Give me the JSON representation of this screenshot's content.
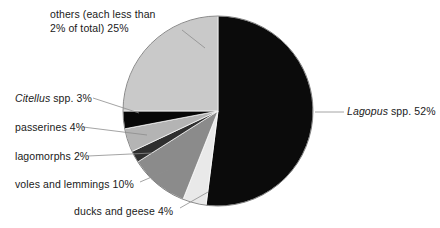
{
  "chart_data": {
    "type": "pie",
    "title": "",
    "subtitle": "",
    "xlabel": "",
    "ylabel": "",
    "legend_position": "none",
    "grid": false,
    "units": "percent of total",
    "total": 100,
    "start_angle_deg": 0,
    "direction": "clockwise",
    "categories": [
      "Lagopus spp.",
      "ducks and geese",
      "voles and lemmings",
      "lagomorphs",
      "passerines",
      "Citellus spp.",
      "others (each less than 2% of total)"
    ],
    "values": [
      52,
      4,
      10,
      2,
      4,
      3,
      25
    ],
    "slices": [
      {
        "id": "lagopus",
        "name_italic": "Lagopus",
        "name_rest": " spp.",
        "label": "Lagopus spp. 52%",
        "value_label": "52%",
        "value": 52,
        "color": "#0b0b0b",
        "label_side": "right"
      },
      {
        "id": "ducks-and-geese",
        "name_italic": "",
        "name_rest": "ducks and geese",
        "label": "ducks and geese 4%",
        "value_label": "4%",
        "value": 4,
        "color": "#e9e9e9",
        "label_side": "bottom"
      },
      {
        "id": "voles-and-lemmings",
        "name_italic": "",
        "name_rest": "voles and lemmings",
        "label": "voles and lemmings 10%",
        "value_label": "10%",
        "value": 10,
        "color": "#8b8b8b",
        "label_side": "left"
      },
      {
        "id": "lagomorphs",
        "name_italic": "",
        "name_rest": "lagomorphs",
        "label": "lagomorphs 2%",
        "value_label": "2%",
        "value": 2,
        "color": "#2f2f2f",
        "label_side": "left"
      },
      {
        "id": "passerines",
        "name_italic": "",
        "name_rest": "passerines",
        "label": "passerines 4%",
        "value_label": "4%",
        "value": 4,
        "color": "#b4b4b4",
        "label_side": "left"
      },
      {
        "id": "citellus",
        "name_italic": "Citellus",
        "name_rest": " spp.",
        "label": "Citellus spp. 3%",
        "value_label": "3%",
        "value": 3,
        "color": "#070707",
        "label_side": "left"
      },
      {
        "id": "others",
        "name_italic": "",
        "name_rest": "others (each less than 2% of total)",
        "label": "others (each less than 2% of total) 25%",
        "value_label": "25%",
        "value": 25,
        "color": "#c9c9c9",
        "label_side": "top-left"
      }
    ]
  },
  "labels": {
    "others_line1": "others (each less than",
    "others_line2": "2% of total) 25%",
    "citellus_italic": "Citellus",
    "citellus_rest": " spp. 3%",
    "passerines": "passerines 4%",
    "lagomorphs": "lagomorphs 2%",
    "voles": "voles and lemmings 10%",
    "ducks": "ducks and geese 4%",
    "lagopus_italic": "Lagopus",
    "lagopus_rest": " spp. 52%"
  },
  "colors": {
    "background": "#ffffff",
    "text": "#1a1a1a",
    "leader_line": "#8d8d8d",
    "slice_black": "#0b0b0b",
    "slice_light_gray": "#c9c9c9",
    "slice_mid_gray": "#8b8b8b",
    "slice_pale": "#e9e9e9",
    "slice_dark_gray": "#2f2f2f",
    "slice_silver": "#b4b4b4"
  }
}
